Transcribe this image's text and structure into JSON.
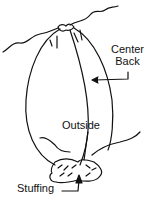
{
  "diagram": {
    "labels": {
      "center_back_line1": "Center",
      "center_back_line2": "Back",
      "outside": "Outside",
      "stuffing": "Stuffing"
    },
    "colors": {
      "line": "#111111",
      "background": "#ffffff"
    }
  }
}
